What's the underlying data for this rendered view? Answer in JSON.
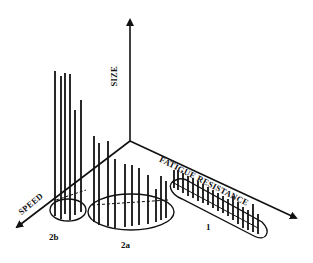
{
  "diagram": {
    "colors": {
      "ink": "#111111",
      "background": "#ffffff"
    },
    "origin": [
      130,
      141
    ],
    "axes": {
      "size": {
        "label": "SIZE",
        "tip": [
          130,
          20
        ]
      },
      "fatigue": {
        "label": "FATIGUE RESISTANCE",
        "tip": [
          296,
          218
        ]
      },
      "speed": {
        "label": "SPEED",
        "tip": [
          17,
          227
        ]
      }
    },
    "clusters": [
      {
        "id": "2b",
        "label": "2b",
        "bars": [
          [
            55,
            71,
            216
          ],
          [
            61,
            76,
            219
          ],
          [
            65,
            73,
            214
          ],
          [
            70,
            74,
            220
          ],
          [
            75,
            110,
            215
          ],
          [
            81,
            100,
            212
          ]
        ]
      },
      {
        "id": "2a",
        "label": "2a",
        "bars": [
          [
            94,
            136,
            222
          ],
          [
            99,
            143,
            225
          ],
          [
            108,
            141,
            226
          ],
          [
            115,
            159,
            228
          ],
          [
            125,
            164,
            227
          ],
          [
            132,
            165,
            226
          ],
          [
            139,
            168,
            225
          ],
          [
            148,
            175,
            224
          ],
          [
            156,
            189,
            222
          ],
          [
            161,
            176,
            220
          ],
          [
            166,
            181,
            218
          ]
        ]
      },
      {
        "id": "1",
        "label": "1",
        "bars": [
          [
            174,
            170,
            188
          ],
          [
            178,
            170,
            190
          ],
          [
            183,
            173,
            193
          ],
          [
            188,
            176,
            196
          ],
          [
            193,
            178,
            198
          ],
          [
            198,
            181,
            201
          ],
          [
            203,
            184,
            203
          ],
          [
            208,
            187,
            205
          ],
          [
            213,
            190,
            208
          ],
          [
            218,
            193,
            211
          ],
          [
            223,
            196,
            213
          ],
          [
            228,
            199,
            216
          ],
          [
            233,
            196,
            220
          ],
          [
            238,
            202,
            224
          ],
          [
            243,
            207,
            228
          ],
          [
            248,
            210,
            230
          ],
          [
            253,
            204,
            232
          ],
          [
            258,
            214,
            234
          ]
        ]
      }
    ]
  }
}
